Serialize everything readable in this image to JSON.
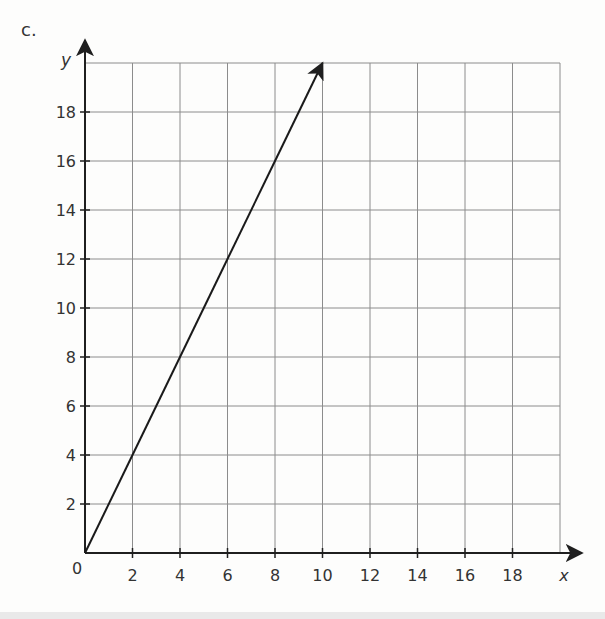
{
  "part_label": "c.",
  "chart_data": {
    "type": "line",
    "title": "",
    "xlabel": "x",
    "ylabel": "y",
    "xlim": [
      0,
      20
    ],
    "ylim": [
      0,
      20
    ],
    "grid": true,
    "grid_step": 2,
    "origin_label": "0",
    "x_ticks": [
      2,
      4,
      6,
      8,
      10,
      12,
      14,
      16,
      18
    ],
    "y_ticks": [
      2,
      4,
      6,
      8,
      10,
      12,
      14,
      16,
      18
    ],
    "series": [
      {
        "name": "y = 2x",
        "x": [
          0,
          2,
          4,
          6,
          8,
          10
        ],
        "y": [
          0,
          4,
          8,
          12,
          16,
          20
        ],
        "arrow_end": true
      }
    ],
    "axes_arrows": true
  },
  "colors": {
    "axis": "#1f1f1f",
    "grid": "#8c8c8c",
    "line": "#1a1a1a",
    "text": "#333333",
    "background": "#fdfdfc",
    "band": "#e9e9e9"
  }
}
